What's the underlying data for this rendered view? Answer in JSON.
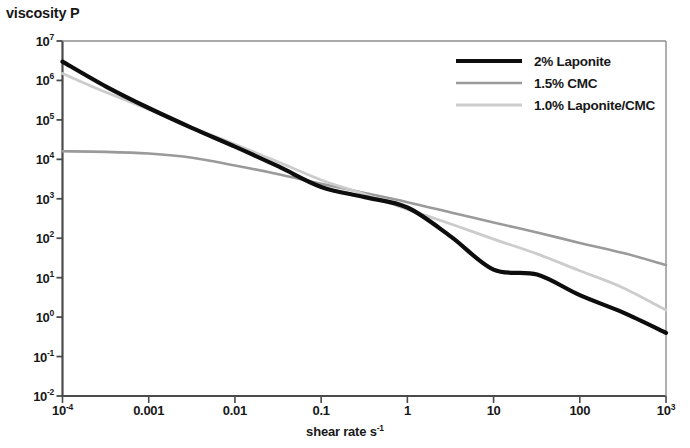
{
  "chart_data": {
    "type": "line",
    "title": "",
    "xlabel": "shear rate s⁻¹",
    "ylabel": "viscosity P",
    "xscale": "log",
    "yscale": "log",
    "xlim": [
      0.0001,
      1000
    ],
    "ylim": [
      0.01,
      10000000
    ],
    "grid": false,
    "legend_position": "top-right-inside",
    "xtick_labels": [
      "10⁻⁴",
      "0.001",
      "0.01",
      "0.1",
      "1",
      "10",
      "100",
      "10³"
    ],
    "xtick_values": [
      0.0001,
      0.001,
      0.01,
      0.1,
      1,
      10,
      100,
      1000
    ],
    "ytick_labels": [
      "10⁷",
      "10⁶",
      "10⁵",
      "10⁴",
      "10³",
      "10²",
      "10¹",
      "10⁰",
      "10⁻¹",
      "10⁻²"
    ],
    "ytick_values": [
      10000000,
      1000000,
      100000,
      10000,
      1000,
      100,
      10,
      1,
      0.1,
      0.01
    ],
    "series": [
      {
        "name": "2% Laponite",
        "color": "#0d0d0d",
        "width": 4.2,
        "x": [
          0.0001,
          0.00032,
          0.001,
          0.0032,
          0.01,
          0.032,
          0.1,
          0.32,
          1,
          3.2,
          10,
          32,
          100,
          320,
          1000
        ],
        "y": [
          3000000,
          700000,
          200000,
          62000,
          21000,
          6600,
          2000,
          1100,
          600,
          110,
          16,
          12,
          3.6,
          1.3,
          0.4
        ]
      },
      {
        "name": "1.5% CMC",
        "color": "#9a9a9a",
        "width": 2.6,
        "x": [
          0.0001,
          0.00032,
          0.001,
          0.0032,
          0.01,
          0.032,
          0.1,
          0.32,
          1,
          3.2,
          10,
          32,
          100,
          320,
          1000
        ],
        "y": [
          16000,
          15500,
          14000,
          11000,
          7000,
          4200,
          2400,
          1400,
          820,
          450,
          250,
          140,
          76,
          42,
          21
        ]
      },
      {
        "name": "1.0% Laponite/CMC",
        "color": "#cccccc",
        "width": 2.8,
        "x": [
          0.0001,
          0.00032,
          0.001,
          0.0032,
          0.01,
          0.032,
          0.1,
          0.32,
          1,
          3.2,
          10,
          32,
          100,
          320,
          1000
        ],
        "y": [
          1500000,
          500000,
          185000,
          64000,
          24000,
          8500,
          3000,
          1300,
          540,
          230,
          95,
          40,
          15,
          5.5,
          1.5
        ]
      }
    ]
  },
  "axes": {
    "y_axis_title": "viscosity P",
    "x_axis_title": "shear rate s",
    "x_axis_title_exponent": "-1",
    "yticks": [
      {
        "label": "10",
        "exp": "7"
      },
      {
        "label": "10",
        "exp": "6"
      },
      {
        "label": "10",
        "exp": "5"
      },
      {
        "label": "10",
        "exp": "4"
      },
      {
        "label": "10",
        "exp": "3"
      },
      {
        "label": "10",
        "exp": "2"
      },
      {
        "label": "10",
        "exp": "1"
      },
      {
        "label": "10",
        "exp": "0"
      },
      {
        "label": "10",
        "exp": "-1"
      },
      {
        "label": "10",
        "exp": "-2"
      }
    ],
    "xticks": [
      {
        "label": "10",
        "exp": "-4"
      },
      {
        "label": "0.001",
        "exp": ""
      },
      {
        "label": "0.01",
        "exp": ""
      },
      {
        "label": "0.1",
        "exp": ""
      },
      {
        "label": "1",
        "exp": ""
      },
      {
        "label": "10",
        "exp": ""
      },
      {
        "label": "100",
        "exp": ""
      },
      {
        "label": "10",
        "exp": "3"
      }
    ]
  },
  "legend": {
    "items": [
      {
        "label": "2% Laponite",
        "color": "#0d0d0d",
        "width": 4.2
      },
      {
        "label": "1.5% CMC",
        "color": "#9a9a9a",
        "width": 2.6
      },
      {
        "label": "1.0% Laponite/CMC",
        "color": "#cccccc",
        "width": 2.8
      }
    ]
  },
  "style": {
    "background": "#ffffff",
    "axis_color": "#555555",
    "text_color": "#181818"
  }
}
